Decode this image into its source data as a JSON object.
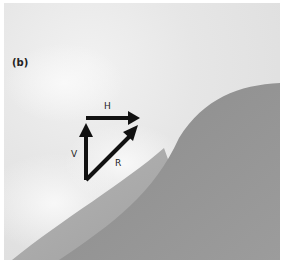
{
  "figure": {
    "panel_label": "(b)",
    "vectors": [
      {
        "name": "H",
        "label": "H",
        "direction": "horizontal"
      },
      {
        "name": "V",
        "label": "V",
        "direction": "vertical"
      },
      {
        "name": "R",
        "label": "R",
        "direction": "resultant-diagonal"
      }
    ],
    "colors": {
      "background_light": "#e8e8e8",
      "hill_light": "#a8a8a8",
      "hill_dark": "#8a8a8a",
      "arrow": "#111111"
    }
  }
}
